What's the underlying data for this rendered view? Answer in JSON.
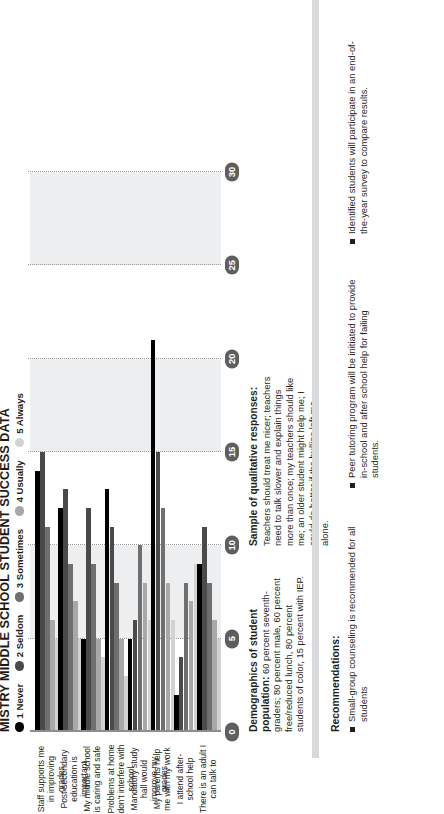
{
  "title": "MISTRY MIDDLE SCHOOL STUDENT SUCCESS DATA",
  "legend": [
    {
      "label": "1 Never",
      "color": "#000000"
    },
    {
      "label": "2 Seldom",
      "color": "#4a4a4a"
    },
    {
      "label": "3 Sometimes",
      "color": "#6f6f6f"
    },
    {
      "label": "4 Usually",
      "color": "#a8a8a8"
    },
    {
      "label": "5 Always",
      "color": "#d2d2d2"
    }
  ],
  "axis": {
    "ticks": [
      "0",
      "5",
      "10",
      "15",
      "20",
      "25",
      "30"
    ],
    "max": 30
  },
  "demographics": {
    "heading": "Demographics of student population:",
    "body": " 60 percent seventh-graders; 80 percent male, 60 percent free/reduced lunch, 80 percent students of color, 15 percent with IEP."
  },
  "qualitative": {
    "heading": "Sample of qualitative responses:",
    "body": "Teachers should treat me nicer; teachers need to talk slower and explain things more than once; my teachers should like me; an older student might help me; I could do better if the bullies left me alone."
  },
  "recommendations": {
    "heading": "Recommendations:",
    "items": [
      "Small-group counseling is recommended for all students",
      "Peer tutoring program will be initiated to provide in-school and after school help for failing students.",
      "Identified students will participate in an end-of-the-year survey to compare results."
    ]
  },
  "chart_data": {
    "type": "bar",
    "title": "MISTRY MIDDLE SCHOOL STUDENT SUCCESS DATA",
    "xlabel": "",
    "ylabel": "",
    "ylim": [
      0,
      30
    ],
    "grid": true,
    "legend_position": "top-left",
    "orientation": "horizontal-grouped",
    "categories": [
      "Staff supports me in improving grades",
      "Post-secondary education is important",
      "My middle school is caring and safe",
      "Problems at home don't interfere with school",
      "Mandatory study hall would improve my grades",
      "My parents help me with my work",
      "I attend after-school help",
      "There is an adult I can talk to"
    ],
    "series": [
      {
        "name": "1 Never",
        "color": "#000000",
        "values": [
          14,
          12,
          5,
          13,
          5,
          21,
          2,
          9
        ]
      },
      {
        "name": "2 Seldom",
        "color": "#4a4a4a",
        "values": [
          15,
          13,
          12,
          11,
          6,
          15,
          4,
          11
        ]
      },
      {
        "name": "3 Sometimes",
        "color": "#6f6f6f",
        "values": [
          11,
          9,
          9,
          8,
          10,
          12,
          8,
          8
        ]
      },
      {
        "name": "4 Usually",
        "color": "#a8a8a8",
        "values": [
          6,
          7,
          5,
          5,
          8,
          8,
          7,
          6
        ]
      },
      {
        "name": "5 Always",
        "color": "#d2d2d2",
        "values": [
          5,
          5,
          4,
          3,
          6,
          6,
          9,
          5
        ]
      }
    ]
  }
}
